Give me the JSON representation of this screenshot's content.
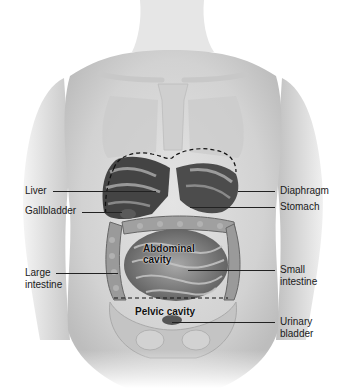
{
  "diagram": {
    "left_labels": [
      {
        "id": "liver",
        "text": "Liver"
      },
      {
        "id": "gallbladder",
        "text": "Gallbladder"
      },
      {
        "id": "large-intestine",
        "line1": "Large",
        "line2": "intestine"
      }
    ],
    "right_labels": [
      {
        "id": "diaphragm",
        "text": "Diaphragm"
      },
      {
        "id": "stomach",
        "text": "Stomach"
      },
      {
        "id": "small-intestine",
        "line1": "Small",
        "line2": "intestine"
      },
      {
        "id": "urinary-bladder",
        "line1": "Urinary",
        "line2": "bladder"
      }
    ],
    "region_labels": [
      {
        "id": "abdominal-cavity",
        "line1": "Abdominal",
        "line2": "cavity"
      },
      {
        "id": "pelvic-cavity",
        "text": "Pelvic cavity"
      }
    ],
    "colors": {
      "skin": "#d9d9d9",
      "organ_dark": "#3a3a3a",
      "organ_mid": "#7a7a7a",
      "intestine": "#9a9a9a",
      "leader_line": "#222222",
      "dashed_boundary": "#111111"
    }
  }
}
